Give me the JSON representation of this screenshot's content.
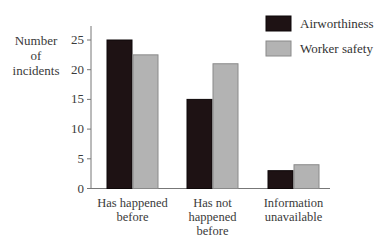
{
  "chart_data": {
    "type": "bar",
    "title": "",
    "xlabel": "",
    "ylabel": "Number of incidents",
    "ylabel_lines": [
      "Number",
      "of",
      "incidents"
    ],
    "ylim": [
      0,
      26
    ],
    "yticks": [
      0,
      5,
      10,
      15,
      20,
      25
    ],
    "grid": false,
    "legend_position": "top-right",
    "categories": [
      "Has happened before",
      "Has not happened before",
      "Information unavailable"
    ],
    "category_lines": [
      [
        "Has happened",
        "before"
      ],
      [
        "Has not",
        "happened",
        "before"
      ],
      [
        "Information",
        "unavailable"
      ]
    ],
    "series": [
      {
        "name": "Airworthiness",
        "color": "#1e1214",
        "values": [
          25,
          15,
          3
        ]
      },
      {
        "name": "Worker safety",
        "color": "#b3b3b3",
        "values": [
          22.5,
          21,
          4
        ]
      }
    ]
  }
}
